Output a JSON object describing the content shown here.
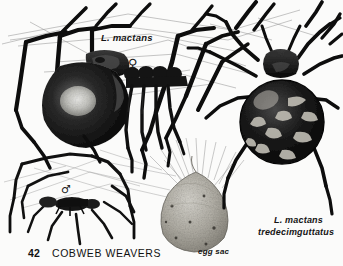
{
  "page": {
    "kind": "field-guide-plate",
    "background_color": "#fbfbfa",
    "ink_color": "#111111",
    "width": 343,
    "height": 266
  },
  "footer": {
    "page_number": "42",
    "section_title": "COBWEB WEAVERS"
  },
  "labels": {
    "female_spider": "L. mactans",
    "variety_line1": "L. mactans",
    "variety_line2": "tredecimguttatus",
    "egg_sac": "egg sac"
  },
  "symbols": {
    "female": "♀",
    "male": "♂"
  },
  "figures": [
    {
      "id": "female-ventral",
      "name": "female black widow hanging in web",
      "label": "L. mactans",
      "sex_symbol": "♀",
      "view": "ventral",
      "shading": "solid black glossy abdomen with light highlight patch"
    },
    {
      "id": "male-small",
      "name": "male black widow in web",
      "sex_symbol": "♂",
      "view": "lateral",
      "shading": "thin outline drawing, small body"
    },
    {
      "id": "egg-sac",
      "name": "egg sac suspended from web threads",
      "label": "egg sac",
      "shading": "stippled grey teardrop"
    },
    {
      "id": "female-dorsal-tredecimguttatus",
      "name": "Latrodectus mactans tredecimguttatus dorsal view",
      "label": "L. mactans tredecimguttatus",
      "view": "dorsal",
      "shading": "black abdomen with pale comma-shaped spots"
    }
  ]
}
